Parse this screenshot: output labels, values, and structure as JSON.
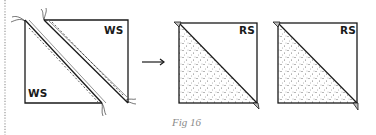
{
  "figure": {
    "caption": "Fig 16",
    "panels": [
      {
        "id": "before",
        "description": "Square with two diagonal stitched strips (seam lines dashed), wrong side showing",
        "labels": [
          "WS",
          "WS"
        ]
      },
      {
        "id": "after-1",
        "description": "Half-square triangle unit, lower-left triangle stippled fabric",
        "labels": [
          "RS"
        ]
      },
      {
        "id": "after-2",
        "description": "Half-square triangle unit, lower-left triangle stippled fabric",
        "labels": [
          "RS"
        ]
      }
    ],
    "arrow": "right-arrow",
    "colors": {
      "line": "#1a1a1a",
      "caption": "#8a8a8a",
      "dotted_border": "#9a9a9a",
      "stipple": "#555555"
    }
  }
}
